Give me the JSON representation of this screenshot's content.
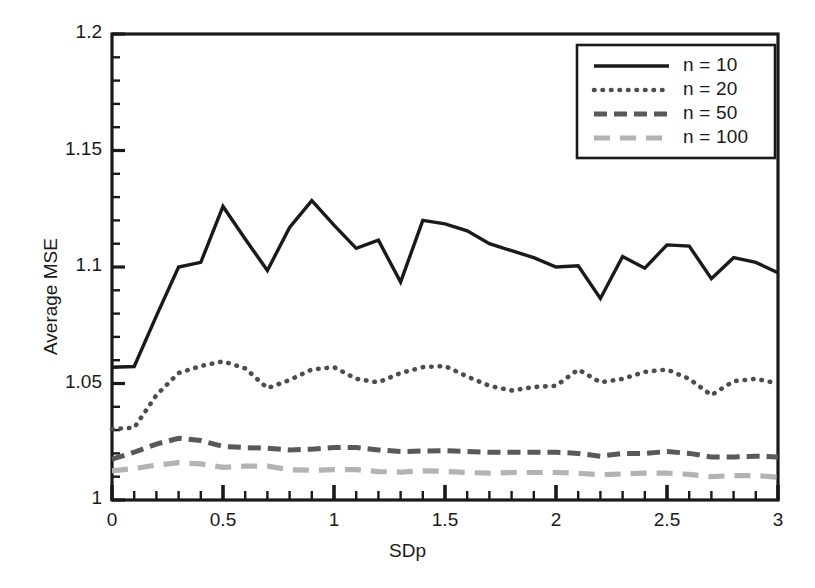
{
  "chart_data": {
    "type": "line",
    "title": "",
    "xlabel": "SDp",
    "ylabel": "Average MSE",
    "xlim": [
      0,
      3
    ],
    "ylim": [
      1,
      1.2
    ],
    "xticks": [
      "0",
      "0.5",
      "1",
      "1.5",
      "2",
      "2.5",
      "3"
    ],
    "xtick_values": [
      0,
      0.5,
      1,
      1.5,
      2,
      2.5,
      3
    ],
    "yticks": [
      "1",
      "1.05",
      "1.1",
      "1.15",
      "1.2"
    ],
    "ytick_values": [
      1,
      1.05,
      1.1,
      1.15,
      1.2
    ],
    "minor_tick_step_x": 0.1,
    "minor_tick_step_y": 0.01,
    "grid": false,
    "legend_position": "top-right",
    "x": [
      0,
      0.1,
      0.2,
      0.3,
      0.4,
      0.5,
      0.6,
      0.7,
      0.8,
      0.9,
      1.0,
      1.1,
      1.2,
      1.3,
      1.4,
      1.5,
      1.6,
      1.7,
      1.8,
      1.9,
      2.0,
      2.1,
      2.2,
      2.3,
      2.4,
      2.5,
      2.6,
      2.7,
      2.8,
      2.9,
      3.0
    ],
    "series": [
      {
        "name": "n = 10",
        "label": "n = 10",
        "style": "solid",
        "color": "#1a1a1a",
        "width": 3.4,
        "dasharray": "",
        "values": [
          1.057,
          1.0573,
          1.079,
          1.1,
          1.102,
          1.126,
          1.112,
          1.0985,
          1.117,
          1.1285,
          1.118,
          1.108,
          1.1115,
          1.0935,
          1.12,
          1.1185,
          1.1155,
          1.11,
          1.107,
          1.104,
          1.1,
          1.1005,
          1.0865,
          1.1045,
          1.0995,
          1.1095,
          1.109,
          1.095,
          1.104,
          1.102,
          1.0975
        ]
      },
      {
        "name": "n = 20",
        "label": "n = 20",
        "style": "dotted",
        "color": "#4d4d4d",
        "width": 4.6,
        "dasharray": "0.5 8",
        "values": [
          1.0305,
          1.031,
          1.045,
          1.0545,
          1.0575,
          1.0595,
          1.0565,
          1.048,
          1.0515,
          1.056,
          1.057,
          1.052,
          1.0505,
          1.0545,
          1.057,
          1.0575,
          1.053,
          1.049,
          1.047,
          1.0485,
          1.049,
          1.056,
          1.0505,
          1.052,
          1.055,
          1.056,
          1.052,
          1.045,
          1.051,
          1.052,
          1.05
        ]
      },
      {
        "name": "n = 50",
        "label": "n = 50",
        "style": "dashed",
        "color": "#595959",
        "width": 5.0,
        "dasharray": "13 7",
        "values": [
          1.0175,
          1.0205,
          1.024,
          1.0265,
          1.0255,
          1.023,
          1.0225,
          1.0222,
          1.0215,
          1.0218,
          1.0225,
          1.0225,
          1.0215,
          1.0208,
          1.021,
          1.0212,
          1.0208,
          1.0205,
          1.0205,
          1.0205,
          1.0205,
          1.02,
          1.0188,
          1.02,
          1.02,
          1.0208,
          1.02,
          1.0185,
          1.0185,
          1.0188,
          1.0185
        ]
      },
      {
        "name": "n = 100",
        "label": "n = 100",
        "style": "long-dash",
        "color": "#b3b3b3",
        "width": 5.2,
        "dasharray": "16 10",
        "values": [
          1.0125,
          1.0135,
          1.015,
          1.016,
          1.0155,
          1.014,
          1.0145,
          1.0145,
          1.013,
          1.0128,
          1.013,
          1.013,
          1.0122,
          1.012,
          1.0125,
          1.0123,
          1.0118,
          1.0115,
          1.0118,
          1.0118,
          1.0118,
          1.0115,
          1.0108,
          1.0112,
          1.0115,
          1.0115,
          1.011,
          1.01,
          1.0105,
          1.0105,
          1.0098
        ]
      }
    ]
  },
  "axes": {
    "y_title": "Average MSE",
    "x_title": "SDp"
  },
  "legend": {
    "entries": [
      {
        "label": "n = 10"
      },
      {
        "label": "n = 20"
      },
      {
        "label": "n = 50"
      },
      {
        "label": "n = 100"
      }
    ]
  },
  "colors": {
    "frame": "#1a1a1a",
    "background": "#ffffff",
    "n10": "#1a1a1a",
    "n20": "#4d4d4d",
    "n50": "#595959",
    "n100": "#b3b3b3"
  }
}
